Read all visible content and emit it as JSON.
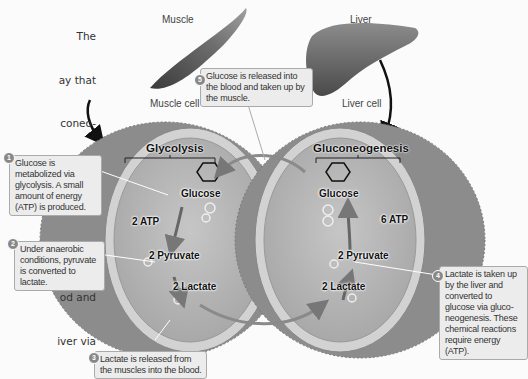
{
  "intro_text_fragments": [
    "The",
    "ay that",
    "coneo-",
    "nited",
    "ak",
    "colysis.",
    "od and",
    "iver via"
  ],
  "organs": {
    "muscle": {
      "label": "Muscle",
      "cell_label": "Muscle cell"
    },
    "liver": {
      "label": "Liver",
      "cell_label": "Liver cell"
    }
  },
  "muscle_cell": {
    "process_title": "Glycolysis",
    "molecules": {
      "glucose": "Glucose",
      "atp": "2 ATP",
      "pyruvate": "2 Pyruvate",
      "lactate": "2 Lactate"
    }
  },
  "liver_cell": {
    "process_title": "Gluconeogenesis",
    "molecules": {
      "glucose": "Glucose",
      "atp": "6 ATP",
      "pyruvate": "2 Pyruvate",
      "lactate": "2 Lactate"
    }
  },
  "callouts": [
    {
      "step": "1",
      "text": "Glucose is metabolized via glycolysis. A small amount of energy (ATP) is produced."
    },
    {
      "step": "2",
      "text": "Under anaerobic conditions, pyruvate is converted to lactate."
    },
    {
      "step": "3",
      "text": "Lactate is released from the muscles into the blood."
    },
    {
      "step": "4",
      "text": "Lactate is taken up by the liver and converted to glucose via gluco-neogenesis. These chemical reactions require energy (ATP)."
    },
    {
      "step": "5",
      "text": "Glucose is released into the blood and taken up by the muscle."
    }
  ],
  "colors": {
    "background": "#fbfbfb",
    "cell_outer": "#8a8a8a",
    "cell_membrane": "#c8c8c8",
    "cytoplasm": "#b4b4b4",
    "callout_bg": "#ececec"
  }
}
